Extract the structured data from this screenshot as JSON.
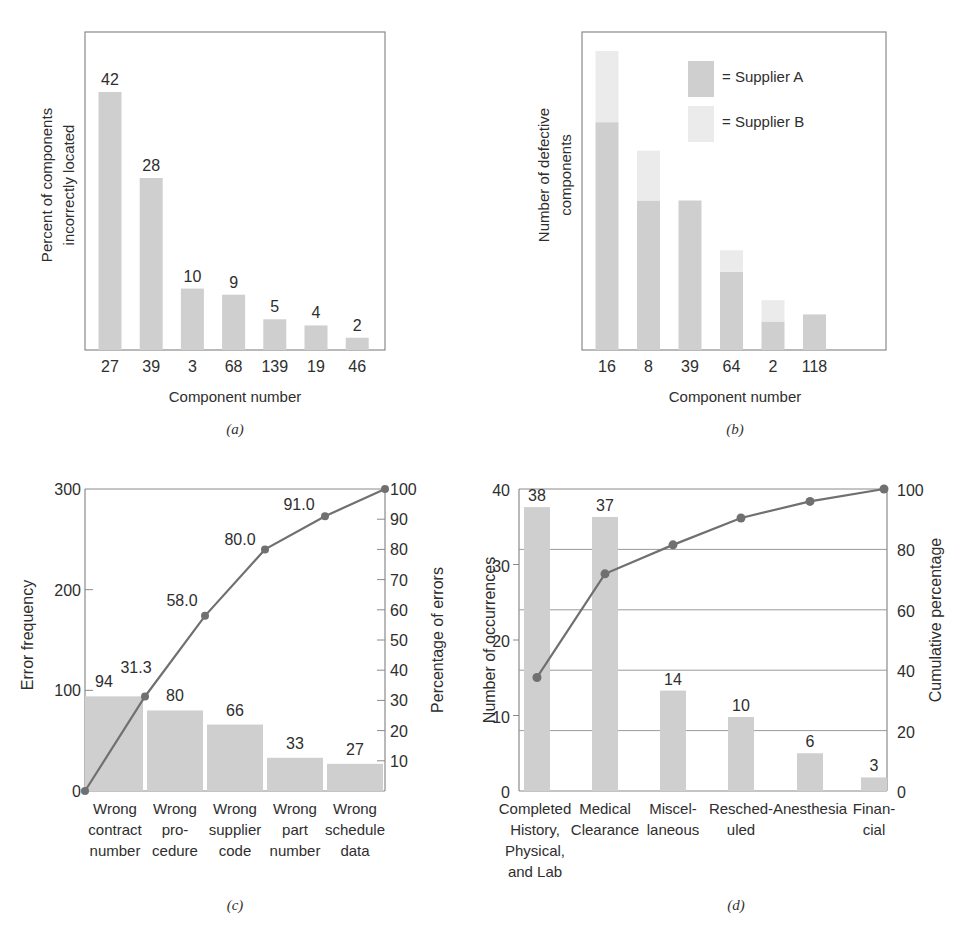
{
  "figure": {
    "panels": [
      "(a)",
      "(b)",
      "(c)",
      "(d)"
    ],
    "colors": {
      "bar": "#cfcfcf",
      "bar_light": "#ebebeb",
      "line": "#707070",
      "axis": "#8a8a8a",
      "grid": "#9a9a9a"
    }
  },
  "chart_data": [
    {
      "id": "a",
      "type": "bar",
      "caption": "(a)",
      "xlabel": "Component number",
      "ylabel": "Percent of components incorrectly located",
      "categories": [
        "27",
        "39",
        "3",
        "68",
        "139",
        "19",
        "46"
      ],
      "values": [
        42,
        28,
        10,
        9,
        5,
        4,
        2
      ],
      "data_labels": [
        "42",
        "28",
        "10",
        "9",
        "5",
        "4",
        "2"
      ],
      "grid": false,
      "ylim": [
        0,
        52
      ]
    },
    {
      "id": "b",
      "type": "bar",
      "stacked": true,
      "caption": "(b)",
      "xlabel": "Component number",
      "ylabel": "Number of defective components",
      "categories": [
        "16",
        "8",
        "39",
        "64",
        "2",
        "118"
      ],
      "series": [
        {
          "name": "Supplier A",
          "values": [
            32,
            21,
            21,
            11,
            4,
            5
          ]
        },
        {
          "name": "Supplier B",
          "values": [
            10,
            7,
            0,
            3,
            3,
            0
          ]
        }
      ],
      "legend": {
        "position": "upper right",
        "entries": [
          "= Supplier A",
          "= Supplier B"
        ]
      },
      "grid": false,
      "note": "No numeric y-axis ticks shown; values estimated in relative units"
    },
    {
      "id": "c",
      "type": "bar",
      "subtype": "pareto",
      "caption": "(c)",
      "ylabel": "Error frequency",
      "y2label": "Percentage of errors",
      "categories": [
        "Wrong contract number",
        "Wrong pro-cedure",
        "Wrong supplier code",
        "Wrong part number",
        "Wrong schedule data"
      ],
      "category_lines": [
        [
          "Wrong",
          "contract",
          "number"
        ],
        [
          "Wrong",
          "pro-",
          "cedure"
        ],
        [
          "Wrong",
          "supplier",
          "code"
        ],
        [
          "Wrong",
          "part",
          "number"
        ],
        [
          "Wrong",
          "schedule",
          "data"
        ]
      ],
      "values": [
        94,
        80,
        66,
        33,
        27
      ],
      "data_labels": [
        "94",
        "80",
        "66",
        "33",
        "27"
      ],
      "cumulative_percent": [
        0,
        31.3,
        58.0,
        80.0,
        91.0,
        100
      ],
      "cumulative_labels": [
        "31.3",
        "58.0",
        "80.0",
        "91.0"
      ],
      "yticks": [
        "0",
        "100",
        "200",
        "300"
      ],
      "y2ticks": [
        "10",
        "20",
        "30",
        "40",
        "50",
        "60",
        "70",
        "80",
        "90",
        "100"
      ],
      "ylim": [
        0,
        300
      ],
      "y2lim": [
        0,
        100
      ],
      "grid": false
    },
    {
      "id": "d",
      "type": "bar",
      "subtype": "pareto",
      "caption": "(d)",
      "ylabel": "Number of occurrences",
      "y2label": "Cumulative percentage",
      "categories": [
        "Completed History, Physical, and Lab",
        "Medical Clearance",
        "Miscel-laneous",
        "Resched-uled",
        "Anesthesia",
        "Finan-cial"
      ],
      "category_lines": [
        [
          "Completed",
          "History,",
          "Physical,",
          "and Lab"
        ],
        [
          "Medical",
          "Clearance"
        ],
        [
          "Miscel-",
          "laneous"
        ],
        [
          "Resched-",
          "uled"
        ],
        [
          "Anesthesia"
        ],
        [
          "Finan-",
          "cial"
        ]
      ],
      "values": [
        38,
        37,
        14,
        10,
        6,
        3
      ],
      "bar_heights": [
        37.6,
        36.3,
        13.3,
        9.8,
        5.0,
        1.8
      ],
      "data_labels": [
        "38",
        "37",
        "14",
        "10",
        "6",
        "3"
      ],
      "cumulative_percent": [
        37.6,
        71.9,
        81.5,
        90.4,
        95.9,
        100
      ],
      "yticks": [
        "0",
        "10",
        "20",
        "30",
        "40"
      ],
      "y2ticks": [
        "0",
        "20",
        "40",
        "60",
        "80",
        "100"
      ],
      "ylim": [
        0,
        40
      ],
      "y2lim": [
        0,
        100
      ],
      "grid": true
    }
  ]
}
